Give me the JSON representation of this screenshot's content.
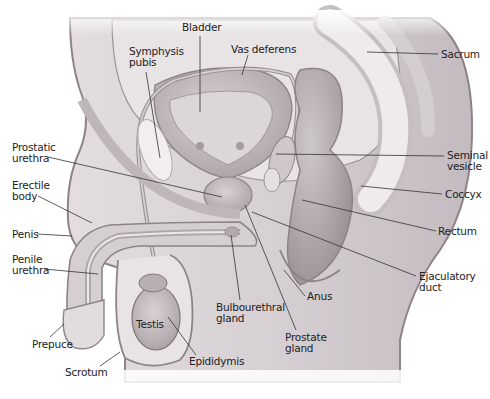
{
  "diagram": {
    "colors": {
      "background": "#ffffff",
      "tissue_light": "#ece8ea",
      "tissue_mid": "#d3cdd0",
      "tissue_dark": "#b9b1b5",
      "outline": "#8e8488",
      "label_text": "#222222"
    },
    "labels": [
      {
        "id": "bladder",
        "text": "Bladder",
        "x": 182,
        "y": 26
      },
      {
        "id": "symphysis-pubis",
        "text": "Symphysis\npubis",
        "x": 129,
        "y": 46
      },
      {
        "id": "vas-deferens",
        "text": "Vas deferens",
        "x": 231,
        "y": 44
      },
      {
        "id": "sacrum",
        "text": "Sacrum",
        "x": 441,
        "y": 49
      },
      {
        "id": "prostatic-urethra",
        "text": "Prostatic\nurethra",
        "x": 12,
        "y": 140
      },
      {
        "id": "seminal-vesicle",
        "text": "Seminal\nvesicle",
        "x": 447,
        "y": 151
      },
      {
        "id": "erectile-body",
        "text": "Erectile\nbody",
        "x": 12,
        "y": 180
      },
      {
        "id": "coccyx",
        "text": "Coccyx",
        "x": 445,
        "y": 189
      },
      {
        "id": "rectum",
        "text": "Rectum",
        "x": 438,
        "y": 226
      },
      {
        "id": "penis",
        "text": "Penis",
        "x": 12,
        "y": 229
      },
      {
        "id": "penile-urethra",
        "text": "Penile\nurethra",
        "x": 12,
        "y": 252
      },
      {
        "id": "ejaculatory-duct",
        "text": "Ejaculatory\nduct",
        "x": 419,
        "y": 271
      },
      {
        "id": "anus",
        "text": "Anus",
        "x": 307,
        "y": 292
      },
      {
        "id": "bulbourethral-gland",
        "text": "Bulbourethral\ngland",
        "x": 216,
        "y": 303
      },
      {
        "id": "testis",
        "text": "Testis",
        "x": 136,
        "y": 319
      },
      {
        "id": "prostate-gland",
        "text": "Prostate\ngland",
        "x": 285,
        "y": 332
      },
      {
        "id": "prepuce",
        "text": "Prepuce",
        "x": 32,
        "y": 339
      },
      {
        "id": "epididymis",
        "text": "Epididymis",
        "x": 189,
        "y": 358
      },
      {
        "id": "scrotum",
        "text": "Scrotum",
        "x": 65,
        "y": 368
      }
    ]
  }
}
